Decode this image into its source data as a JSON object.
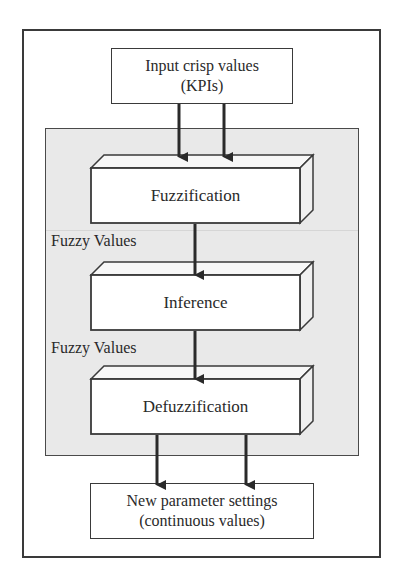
{
  "diagram": {
    "type": "flowchart",
    "input_box": {
      "line1": "Input crisp values",
      "line2": "(KPIs)"
    },
    "stages": [
      {
        "label": "Fuzzification"
      },
      {
        "label": "Inference"
      },
      {
        "label": "Defuzzification"
      }
    ],
    "edge_labels": [
      {
        "label": "Fuzzy Values"
      },
      {
        "label": "Fuzzy Values"
      }
    ],
    "output_box": {
      "line1": "New parameter settings",
      "line2": "(continuous values)"
    },
    "colors": {
      "panel_fill": "#e9e9e9",
      "stroke": "#3a3a3a",
      "box_fill": "#ffffff"
    }
  }
}
